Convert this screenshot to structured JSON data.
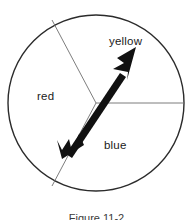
{
  "figure": {
    "caption": "Figure 11-2",
    "colors": {
      "outline": "#2b2b2b",
      "divider": "#6e6e6e",
      "arrow": "#111111",
      "background": "#ffffff",
      "label_text": "#1a1a1a"
    }
  },
  "spinner": {
    "center": {
      "x": 96,
      "y": 103
    },
    "radius": 88,
    "sectors": [
      {
        "name": "red",
        "label": "red",
        "label_x": 37,
        "label_y": 90,
        "start_deg": 153,
        "end_deg": 243
      },
      {
        "name": "yellow",
        "label": "yellow",
        "label_x": 109,
        "label_y": 35,
        "start_deg": 0,
        "end_deg": 153
      },
      {
        "name": "blue",
        "label": "blue",
        "label_x": 104,
        "label_y": 139,
        "start_deg": 243,
        "end_deg": 360
      }
    ],
    "dividers": [
      {
        "name": "upper-left-divider",
        "x2": 52,
        "y2": 20
      },
      {
        "name": "right-divider",
        "x2": 184,
        "y2": 103
      },
      {
        "name": "lower-left-divider",
        "x2": 52,
        "y2": 186
      }
    ],
    "arrow": {
      "tail": {
        "x": 62,
        "y": 158
      },
      "tip": {
        "x": 136,
        "y": 47
      },
      "pointing_at": "yellow"
    }
  }
}
